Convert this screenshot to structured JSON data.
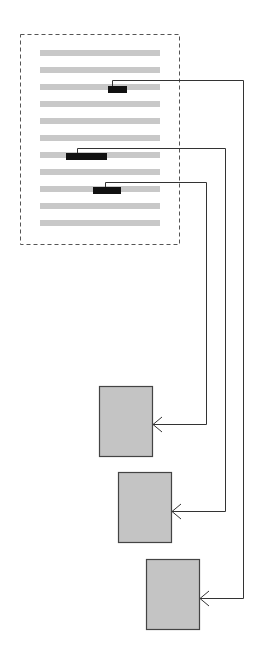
{
  "diagram": {
    "colors": {
      "text_line": "#c8c8c8",
      "highlight": "#111111",
      "connector": "#333333",
      "box_fill": "#c4c4c4",
      "box_stroke": "#444444",
      "frame": "#555555"
    },
    "document": {
      "frame": {
        "x": 20,
        "y": 34,
        "w": 159,
        "h": 210
      },
      "lines": [
        50,
        67,
        84,
        101,
        118,
        135,
        152,
        169,
        186,
        203,
        220
      ],
      "line_x": 40,
      "line_w": 120,
      "line_h": 6
    },
    "highlights": [
      {
        "x": 108,
        "y": 86,
        "w": 19,
        "h": 7,
        "anchor_x": 112
      },
      {
        "x": 66,
        "y": 153,
        "w": 41,
        "h": 7,
        "anchor_x": 77
      },
      {
        "x": 93,
        "y": 187,
        "w": 28,
        "h": 7,
        "anchor_x": 105
      }
    ],
    "targets": [
      {
        "x": 99,
        "y": 386,
        "w": 53,
        "h": 70
      },
      {
        "x": 118,
        "y": 472,
        "w": 53,
        "h": 70
      },
      {
        "x": 146,
        "y": 559,
        "w": 53,
        "h": 70
      }
    ],
    "connectors": [
      {
        "from": 0,
        "to": 2,
        "bend_y": 80,
        "route_x": 243,
        "arrow_y": 598
      },
      {
        "from": 1,
        "to": 1,
        "bend_y": 148,
        "route_x": 225,
        "arrow_y": 511
      },
      {
        "from": 2,
        "to": 0,
        "bend_y": 182,
        "route_x": 206,
        "arrow_y": 424
      }
    ]
  }
}
